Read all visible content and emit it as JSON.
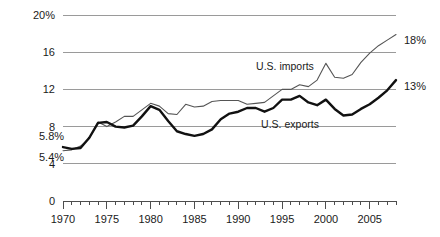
{
  "chart_data": {
    "type": "line",
    "title": "",
    "subtitle": "",
    "xlabel": "",
    "ylabel": "",
    "xlim": [
      1970,
      2008
    ],
    "ylim": [
      0,
      20
    ],
    "grid": true,
    "legend_position": "inline-annotations",
    "y_ticks": [
      {
        "value": 0,
        "label": "0"
      },
      {
        "value": 4,
        "label": "4"
      },
      {
        "value": 8,
        "label": "8"
      },
      {
        "value": 12,
        "label": "12"
      },
      {
        "value": 16,
        "label": "16"
      },
      {
        "value": 20,
        "label": "20%"
      }
    ],
    "x_ticks_major": [
      {
        "value": 1970,
        "label": "1970"
      },
      {
        "value": 1975,
        "label": "1975"
      },
      {
        "value": 1980,
        "label": "1980"
      },
      {
        "value": 1985,
        "label": "1985"
      },
      {
        "value": 1990,
        "label": "1990"
      },
      {
        "value": 1995,
        "label": "1995"
      },
      {
        "value": 2000,
        "label": "2000"
      },
      {
        "value": 2005,
        "label": "2005"
      }
    ],
    "x_tick_step_minor": 1,
    "x": [
      1970,
      1971,
      1972,
      1973,
      1974,
      1975,
      1976,
      1977,
      1978,
      1979,
      1980,
      1981,
      1982,
      1983,
      1984,
      1985,
      1986,
      1987,
      1988,
      1989,
      1990,
      1991,
      1992,
      1993,
      1994,
      1995,
      1996,
      1997,
      1998,
      1999,
      2000,
      2001,
      2002,
      2003,
      2004,
      2005,
      2006,
      2007,
      2008
    ],
    "series": [
      {
        "name": "U.S. imports",
        "label": "U.S. imports",
        "style": "thin-gray",
        "start_label": "5.4%",
        "end_label": "18%",
        "values": [
          5.4,
          5.5,
          5.9,
          6.7,
          8.5,
          8.0,
          8.5,
          9.1,
          9.1,
          9.8,
          10.5,
          10.2,
          9.4,
          9.3,
          10.4,
          10.1,
          10.2,
          10.7,
          10.8,
          10.8,
          10.8,
          10.4,
          10.5,
          10.6,
          11.3,
          12.0,
          12.0,
          12.5,
          12.3,
          13.0,
          14.8,
          13.3,
          13.2,
          13.6,
          14.9,
          15.9,
          16.7,
          17.3,
          17.9
        ]
      },
      {
        "name": "U.S. exports",
        "label": "U.S. exports",
        "style": "thick-black",
        "start_label": "5.8%",
        "end_label": "13%",
        "values": [
          5.8,
          5.6,
          5.7,
          6.8,
          8.4,
          8.5,
          8.0,
          7.9,
          8.1,
          9.1,
          10.2,
          9.8,
          8.6,
          7.5,
          7.2,
          7.0,
          7.2,
          7.7,
          8.8,
          9.4,
          9.6,
          10.0,
          10.0,
          9.6,
          10.0,
          10.9,
          10.9,
          11.3,
          10.6,
          10.3,
          10.9,
          9.9,
          9.2,
          9.3,
          9.9,
          10.4,
          11.1,
          11.9,
          13.0
        ]
      }
    ],
    "annotations": [
      {
        "name": "imports-series-label",
        "text": "U.S. imports",
        "x_px": 285,
        "y_px": 70
      },
      {
        "name": "exports-series-label",
        "text": "U.S. exports",
        "x_px": 290,
        "y_px": 128
      },
      {
        "name": "imports-start-value",
        "text": "5.4%",
        "x_px": 39,
        "y_px": 161
      },
      {
        "name": "exports-start-value",
        "text": "5.8%",
        "x_px": 39,
        "y_px": 140
      },
      {
        "name": "imports-end-value",
        "text": "18%",
        "x_px": 404,
        "y_px": 44
      },
      {
        "name": "exports-end-value",
        "text": "13%",
        "x_px": 404,
        "y_px": 90
      }
    ],
    "colors": {
      "imports_line": "#555555",
      "exports_line": "#111111",
      "gridline": "#9a9a9a",
      "axis": "#4d4d4d",
      "text": "#1a1a1a",
      "background": "#ffffff"
    }
  }
}
